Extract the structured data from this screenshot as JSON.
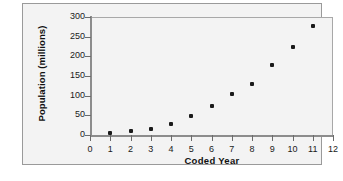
{
  "chart_data": {
    "type": "scatter",
    "title": "",
    "xlabel": "Coded Year",
    "ylabel": "Population (millions)",
    "xlim": [
      0,
      12
    ],
    "ylim": [
      0,
      300
    ],
    "grid": false,
    "legend": "none",
    "x_ticks": [
      "0",
      "1",
      "2",
      "3",
      "4",
      "5",
      "6",
      "7",
      "8",
      "9",
      "10",
      "11",
      "12"
    ],
    "y_ticks": [
      "0",
      "50",
      "100",
      "150",
      "200",
      "250",
      "300"
    ],
    "marker_color": "#1a1a1a",
    "x": [
      1,
      2,
      3,
      4,
      5,
      6,
      7,
      8,
      9,
      10,
      11
    ],
    "values": [
      4,
      9,
      16,
      29,
      48,
      74,
      104,
      129,
      177,
      224,
      278
    ],
    "points": [
      {
        "x": 1,
        "y": 4
      },
      {
        "x": 2,
        "y": 9
      },
      {
        "x": 3,
        "y": 16
      },
      {
        "x": 4,
        "y": 29
      },
      {
        "x": 5,
        "y": 48
      },
      {
        "x": 6,
        "y": 74
      },
      {
        "x": 7,
        "y": 104
      },
      {
        "x": 8,
        "y": 129
      },
      {
        "x": 9,
        "y": 177
      },
      {
        "x": 10,
        "y": 224
      },
      {
        "x": 11,
        "y": 278
      }
    ]
  },
  "colors": {
    "frame_border": "#9a9a9a",
    "plot_background": "#f3f3f3",
    "axis": "#8c8c8c",
    "text": "#1a1a1a"
  }
}
